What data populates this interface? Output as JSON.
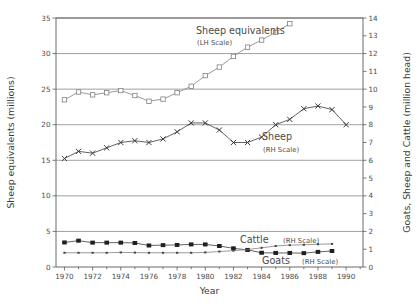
{
  "chart_data": {
    "type": "line",
    "title": "",
    "xlabel": "Year",
    "ylabel_left": "Sheep equivalents (millions)",
    "ylabel_right": "Goats, Sheep and Cattle (million head)",
    "xlim": [
      1969.4,
      1991.2
    ],
    "ylim_left": [
      0,
      35
    ],
    "ylim_right": [
      0,
      14
    ],
    "left_ticks": [
      0,
      5,
      10,
      15,
      20,
      25,
      30,
      35
    ],
    "right_ticks": [
      0,
      1,
      2,
      3,
      4,
      5,
      6,
      7,
      8,
      9,
      10,
      11,
      12,
      13,
      14
    ],
    "x_ticks": [
      1970,
      1972,
      1974,
      1976,
      1978,
      1980,
      1982,
      1984,
      1986,
      1988,
      1990
    ],
    "x_minor_ticks": [
      1971,
      1973,
      1975,
      1977,
      1979,
      1981,
      1983,
      1985,
      1987,
      1989,
      1991
    ],
    "grid": "horizontal-left-axis",
    "legend_position": "inline-annotations",
    "years": [
      1970,
      1971,
      1972,
      1973,
      1974,
      1975,
      1976,
      1977,
      1978,
      1979,
      1980,
      1981,
      1982,
      1983,
      1984,
      1985,
      1986,
      1987,
      1988,
      1989
    ],
    "series": [
      {
        "name": "Sheep equivalents",
        "axis": "left",
        "marker": "open-square",
        "label": "Sheep equivalents",
        "sublabel": "(LH Scale)",
        "values": [
          23.5,
          24.6,
          24.2,
          24.5,
          24.8,
          24.1,
          23.3,
          23.6,
          24.5,
          25.4,
          26.9,
          28.1,
          29.6,
          30.9,
          31.9,
          33.0,
          34.2,
          null,
          null,
          null
        ]
      },
      {
        "name": "Sheep",
        "axis": "right",
        "marker": "cross",
        "label": "Sheep",
        "sublabel": "(RH Scale)",
        "values": [
          6.1,
          6.5,
          6.4,
          6.7,
          7.0,
          7.1,
          7.0,
          7.2,
          7.6,
          8.1,
          8.1,
          7.7,
          7.0,
          7.0,
          7.3,
          8.0,
          8.3,
          8.9,
          9.05,
          8.85,
          8.0
        ]
      },
      {
        "name": "Goats",
        "axis": "right",
        "marker": "filled-square",
        "label": "Goats",
        "sublabel": "(RH Scale)",
        "values": [
          1.38,
          1.48,
          1.37,
          1.37,
          1.37,
          1.35,
          1.21,
          1.23,
          1.24,
          1.27,
          1.27,
          1.18,
          1.05,
          0.96,
          0.8,
          0.79,
          0.79,
          0.78,
          0.85,
          0.9
        ]
      },
      {
        "name": "Cattle",
        "axis": "right",
        "marker": "small-dot",
        "label": "Cattle",
        "sublabel": "(RH Scale)",
        "values": [
          0.8,
          0.8,
          0.8,
          0.8,
          0.82,
          0.81,
          0.8,
          0.8,
          0.8,
          0.8,
          0.82,
          0.87,
          0.92,
          0.98,
          1.08,
          1.18,
          1.23,
          1.25,
          1.28,
          1.3
        ]
      }
    ],
    "annotations": [
      {
        "name": "sheep-equivalents-label",
        "text": "Sheep equivalents",
        "sub": "(LH Scale)"
      },
      {
        "name": "sheep-label",
        "text": "Sheep",
        "sub": "(RH Scale)"
      },
      {
        "name": "cattle-label",
        "text": "Cattle",
        "sub": "(RH Scale)"
      },
      {
        "name": "goats-label",
        "text": "Goats",
        "sub": "(RH Scale)"
      }
    ]
  },
  "axes": {
    "x_title": "Year",
    "y_left_title": "Sheep equivalents (millions)",
    "y_right_title": "Goats, Sheep and Cattle (million head)",
    "left_tick_labels": [
      "0",
      "5",
      "10",
      "15",
      "20",
      "25",
      "30",
      "35"
    ],
    "right_tick_labels": [
      "0",
      "1",
      "2",
      "3",
      "4",
      "5",
      "6",
      "7",
      "8",
      "9",
      "10",
      "11",
      "12",
      "13",
      "14"
    ],
    "x_tick_labels": [
      "1970",
      "1972",
      "1974",
      "1976",
      "1978",
      "1980",
      "1982",
      "1984",
      "1986",
      "1988",
      "1990"
    ]
  },
  "labels": {
    "sheep_equiv_main": "Sheep equivalents",
    "sheep_equiv_sub": "(LH Scale)",
    "sheep_main": "Sheep",
    "sheep_sub": "(RH Scale)",
    "cattle_main": "Cattle",
    "cattle_sub": "(RH Scale)",
    "goats_main": "Goats",
    "goats_sub": "(RH Scale)"
  },
  "colors": {
    "background": "#ffffff",
    "axis": "#5a5a5a",
    "grid": "#777777",
    "series_light": "#808080",
    "series_dark": "#3a3a3a",
    "text": "#4a4a4a"
  }
}
